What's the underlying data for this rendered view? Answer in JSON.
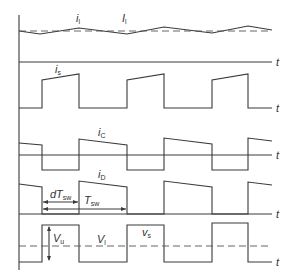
{
  "diagram": {
    "time_axis_label": "t",
    "panels": [
      {
        "id": "inductor-current",
        "labels": [
          {
            "main": "i",
            "sub": "l"
          },
          {
            "main": "I",
            "sub": "l"
          }
        ]
      },
      {
        "id": "switch-current",
        "labels": [
          {
            "main": "i",
            "sub": "s"
          }
        ]
      },
      {
        "id": "capacitor-current",
        "labels": [
          {
            "main": "i",
            "sub": "C"
          }
        ]
      },
      {
        "id": "diode-current",
        "labels": [
          {
            "main": "i",
            "sub": "D"
          },
          {
            "main": "dT",
            "sub": "sw"
          },
          {
            "main": "T",
            "sub": "sw"
          }
        ]
      },
      {
        "id": "switch-voltage",
        "labels": [
          {
            "main": "V",
            "sub": "u"
          },
          {
            "main": "V",
            "sub": "l"
          },
          {
            "main": "v",
            "sub": "s"
          }
        ]
      }
    ]
  },
  "colors": {
    "line": "#3a3a3a",
    "text": "#333333",
    "background": "#ffffff"
  }
}
